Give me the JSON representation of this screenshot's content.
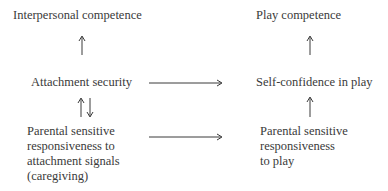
{
  "diagram": {
    "type": "flow",
    "nodes": {
      "interpersonal_competence": {
        "lines": [
          "Interpersonal competence"
        ]
      },
      "attachment_security": {
        "lines": [
          "Attachment security"
        ]
      },
      "parental_caregiving": {
        "lines": [
          "Parental sensitive",
          "responsiveness to",
          "attachment signals",
          "(caregiving)"
        ]
      },
      "play_competence": {
        "lines": [
          "Play competence"
        ]
      },
      "self_confidence_in_play": {
        "lines": [
          "Self-confidence in play"
        ]
      },
      "parental_play": {
        "lines": [
          "Parental sensitive",
          "responsiveness",
          "to play"
        ]
      }
    },
    "edges": [
      {
        "from": "attachment_security",
        "to": "interpersonal_competence",
        "style": "single-up"
      },
      {
        "from": "parental_caregiving",
        "to": "attachment_security",
        "style": "bidirectional"
      },
      {
        "from": "attachment_security",
        "to": "self_confidence_in_play",
        "style": "single-right"
      },
      {
        "from": "parental_caregiving",
        "to": "parental_play",
        "style": "single-right"
      },
      {
        "from": "self_confidence_in_play",
        "to": "play_competence",
        "style": "single-up"
      },
      {
        "from": "parental_play",
        "to": "self_confidence_in_play",
        "style": "single-up"
      }
    ],
    "colors": {
      "text": "#3a3a3a",
      "background": "#ffffff"
    }
  }
}
